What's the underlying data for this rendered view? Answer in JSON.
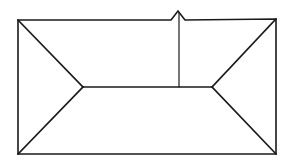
{
  "diagram": {
    "stroke_color": "#1a1a1a",
    "background_color": "#ffffff"
  }
}
